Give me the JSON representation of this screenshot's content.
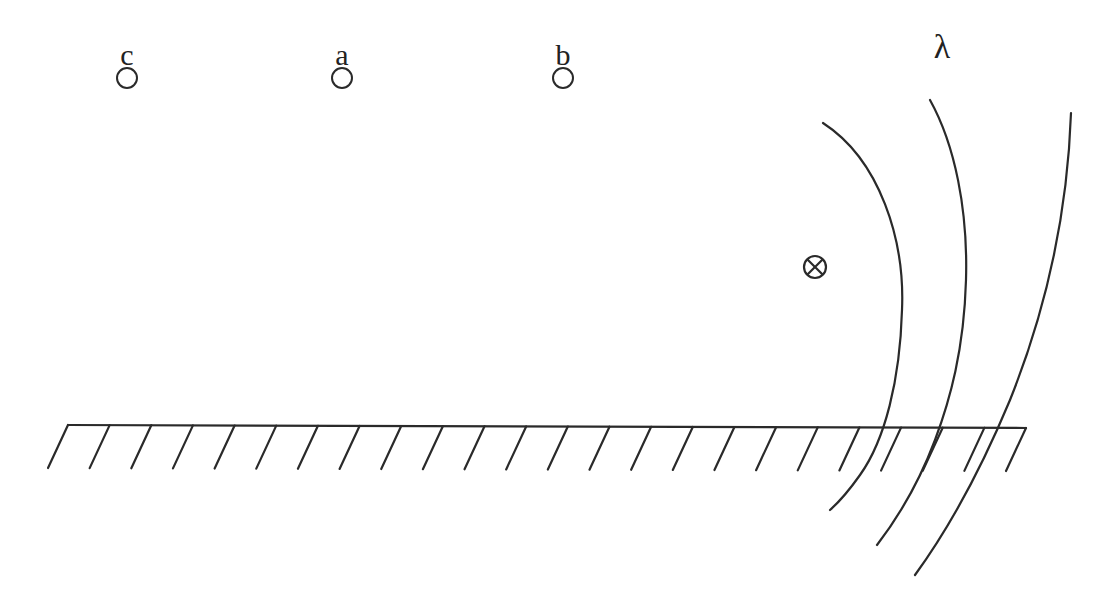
{
  "diagram": {
    "colors": {
      "stroke": "#2a2a2a",
      "background": "#ffffff"
    },
    "points": [
      {
        "id": "c",
        "label": "c",
        "x": 127,
        "y": 78
      },
      {
        "id": "a",
        "label": "a",
        "x": 342,
        "y": 78
      },
      {
        "id": "b",
        "label": "b",
        "x": 563,
        "y": 78
      }
    ],
    "wavelength_label": "λ",
    "source_symbol": {
      "label": "⊗",
      "meaning": "current into page",
      "x": 815,
      "y": 267
    },
    "wavefronts_count": 3,
    "ground": {
      "label": "hatched conducting plane",
      "x1": 68,
      "x2": 1026,
      "y": 427,
      "hatch_count": 24
    }
  }
}
